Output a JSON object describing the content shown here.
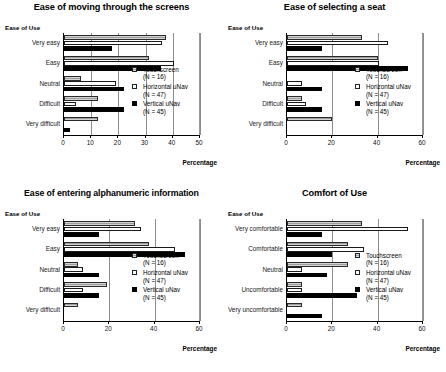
{
  "figure": {
    "series_names": [
      "Touchscreen",
      "Horizontal uNav",
      "Vertical uNav"
    ],
    "series_n": [
      "(N = 16)",
      "(N = 47)",
      "(N = 45)"
    ],
    "y_axis_label": "Ease of Use",
    "x_axis_label": "Percentage",
    "colors": {
      "touchscreen": "#9d9d9d",
      "horizontal_unav": "#ffffff",
      "vertical_unav": "#000000",
      "axis": "#000000",
      "gridline": "#8d8d8d"
    }
  },
  "chart_data": [
    {
      "type": "bar",
      "orientation": "horizontal",
      "title": "Ease of moving through the screens",
      "xlabel": "Percentage",
      "ylabel": "Ease of Use",
      "categories": [
        "Very easy",
        "Easy",
        "Neutral",
        "Difficult",
        "Very difficult"
      ],
      "xlim": [
        0,
        50
      ],
      "xticks": [
        0,
        10,
        20,
        30,
        40,
        50
      ],
      "grid": true,
      "legend_position": "middle-right",
      "series": [
        {
          "name": "Touchscreen",
          "n": 16,
          "values": [
            37.5,
            31.3,
            6.3,
            12.5,
            12.5
          ]
        },
        {
          "name": "Horizontal uNav",
          "n": 47,
          "values": [
            36.2,
            40.4,
            19.1,
            4.3,
            0
          ]
        },
        {
          "name": "Vertical uNav",
          "n": 45,
          "values": [
            17.8,
            35.6,
            22.2,
            22.2,
            2.2
          ]
        }
      ]
    },
    {
      "type": "bar",
      "orientation": "horizontal",
      "title": "Ease of selecting a seat",
      "xlabel": "Percentage",
      "ylabel": "Ease of Use",
      "categories": [
        "Very easy",
        "Easy",
        "Neutral",
        "Difficult",
        "Very difficult"
      ],
      "xlim": [
        0,
        60
      ],
      "xticks": [
        0,
        20,
        40,
        60
      ],
      "grid": true,
      "legend_position": "middle-right",
      "series": [
        {
          "name": "Touchscreen",
          "n": 16,
          "values": [
            33.3,
            40.0,
            0,
            6.7,
            20.0
          ]
        },
        {
          "name": "Horizontal uNav",
          "n": 47,
          "values": [
            44.7,
            40.4,
            6.4,
            8.5,
            0
          ]
        },
        {
          "name": "Vertical uNav",
          "n": 45,
          "values": [
            15.6,
            53.3,
            15.6,
            15.6,
            0
          ]
        }
      ]
    },
    {
      "type": "bar",
      "orientation": "horizontal",
      "title": "Ease of entering alphanumeric information",
      "xlabel": "Percentage",
      "ylabel": "Ease of Use",
      "categories": [
        "Very easy",
        "Easy",
        "Neutral",
        "Difficult",
        "Very difficult"
      ],
      "xlim": [
        0,
        60
      ],
      "xticks": [
        0,
        20,
        40,
        60
      ],
      "grid": true,
      "legend_position": "middle-right",
      "series": [
        {
          "name": "Touchscreen",
          "n": 16,
          "values": [
            31.3,
            37.5,
            6.3,
            18.8,
            6.3
          ]
        },
        {
          "name": "Horizontal uNav",
          "n": 47,
          "values": [
            34.0,
            48.9,
            8.5,
            8.5,
            0
          ]
        },
        {
          "name": "Vertical uNav",
          "n": 45,
          "values": [
            15.6,
            53.3,
            15.6,
            15.6,
            0
          ]
        }
      ]
    },
    {
      "type": "bar",
      "orientation": "horizontal",
      "title": "Comfort of Use",
      "xlabel": "Percentage",
      "ylabel": "Ease of Use",
      "categories": [
        "Very comfortable",
        "Comfortable",
        "Neutral",
        "Uncomfortable",
        "Very uncomfortable"
      ],
      "xlim": [
        0,
        60
      ],
      "xticks": [
        0,
        20,
        40,
        60
      ],
      "grid": true,
      "legend_position": "middle-right",
      "series": [
        {
          "name": "Touchscreen",
          "n": 16,
          "values": [
            33.3,
            26.7,
            26.7,
            6.7,
            6.7
          ]
        },
        {
          "name": "Horizontal uNav",
          "n": 47,
          "values": [
            53.2,
            34.0,
            6.4,
            6.4,
            0
          ]
        },
        {
          "name": "Vertical uNav",
          "n": 45,
          "values": [
            15.6,
            20.0,
            17.8,
            31.1,
            15.6
          ]
        }
      ]
    }
  ]
}
